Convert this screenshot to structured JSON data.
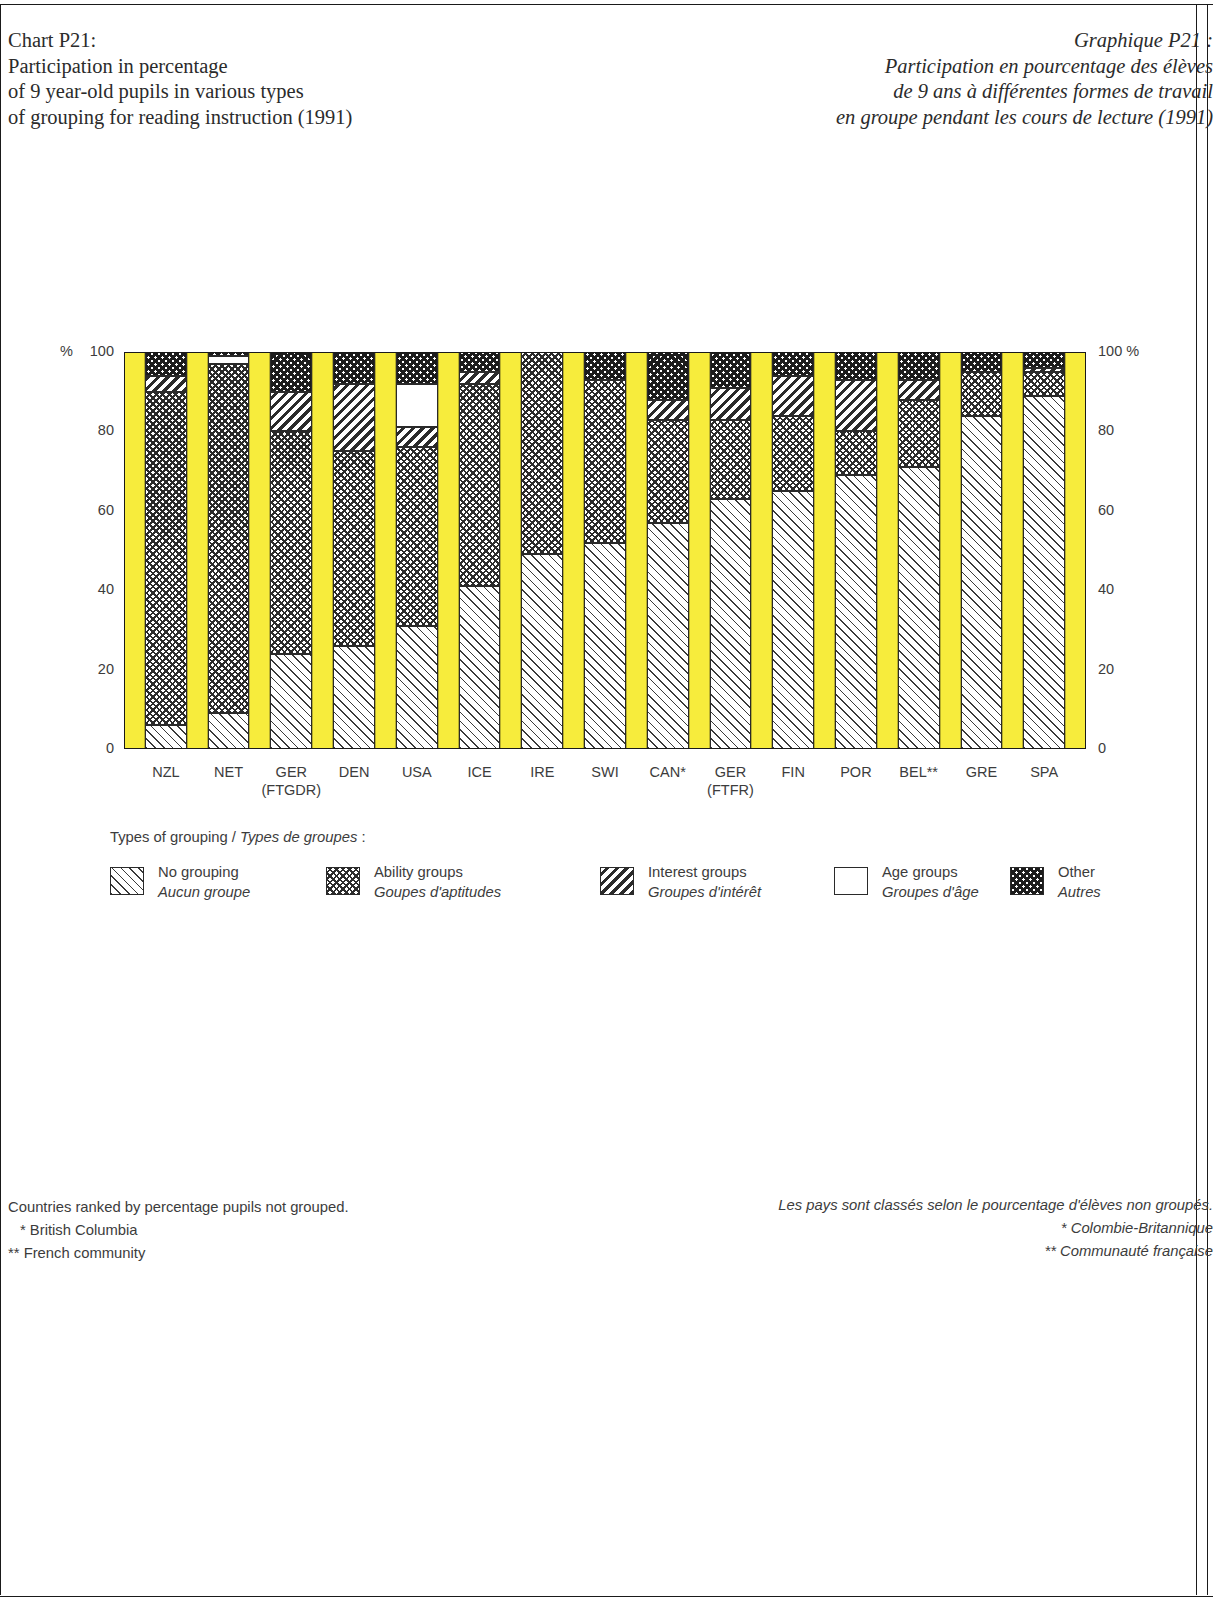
{
  "titles": {
    "en": [
      "Chart P21:",
      "Participation in percentage",
      "of 9 year-old pupils in various types",
      "of grouping for reading instruction (1991)"
    ],
    "fr": [
      "Graphique P21 :",
      "Participation en pourcentage des élèves",
      "de 9 ans à différentes formes de travail",
      "en groupe pendant les cours de lecture (1991)"
    ]
  },
  "axis": {
    "unit_left": "%",
    "unit_right": "100 %",
    "ticks_left": [
      "100",
      "80",
      "60",
      "40",
      "20",
      "0"
    ],
    "ticks_right": [
      "100 %",
      "80",
      "60",
      "40",
      "20",
      "0"
    ]
  },
  "legend": {
    "heading_en": "Types of grouping / ",
    "heading_fr": "Types de groupes",
    "heading_colon": " :",
    "items": [
      {
        "key": "none",
        "en": "No grouping",
        "fr": "Aucun groupe",
        "swatch": "diagonal-hatch-light"
      },
      {
        "key": "ability",
        "en": "Ability groups",
        "fr": "Goupes d'aptitudes",
        "swatch": "cross-hatch-medium"
      },
      {
        "key": "interest",
        "en": "Interest groups",
        "fr": "Groupes d'intérêt",
        "swatch": "diagonal-hatch-heavy"
      },
      {
        "key": "age",
        "en": "Age groups",
        "fr": "Groupes d'âge",
        "swatch": "blank-white"
      },
      {
        "key": "other",
        "en": "Other",
        "fr": "Autres",
        "swatch": "cross-hatch-dark"
      }
    ]
  },
  "footnotes": {
    "left": [
      "Countries ranked by percentage pupils not grouped.",
      "* British Columbia",
      "** French community"
    ],
    "right": [
      "Les pays sont classés selon le pourcentage d'élèves non groupés.",
      "* Colombie-Britannique",
      "** Communauté française"
    ]
  },
  "colors": {
    "separator": "#f7ec3c",
    "ink": "#2a2a2a",
    "text": "#3c3c3c"
  },
  "chart_data": {
    "type": "bar",
    "stacked": true,
    "title": "Participation in percentage of 9 year-old pupils in various types of grouping for reading instruction (1991)",
    "xlabel": "",
    "ylabel": "%",
    "ylim": [
      0,
      100
    ],
    "yticks": [
      0,
      20,
      40,
      60,
      80,
      100
    ],
    "grid": false,
    "legend_position": "below",
    "categories": [
      "NZL",
      "NET",
      "GER\n(FTGDR)",
      "DEN",
      "USA",
      "ICE",
      "IRE",
      "SWI",
      "CAN*",
      "GER\n(FTFR)",
      "FIN",
      "POR",
      "BEL**",
      "GRE",
      "SPA"
    ],
    "category_labels": [
      {
        "line1": "NZL",
        "line2": ""
      },
      {
        "line1": "NET",
        "line2": ""
      },
      {
        "line1": "GER",
        "line2": "(FTGDR)"
      },
      {
        "line1": "DEN",
        "line2": ""
      },
      {
        "line1": "USA",
        "line2": ""
      },
      {
        "line1": "ICE",
        "line2": ""
      },
      {
        "line1": "IRE",
        "line2": ""
      },
      {
        "line1": "SWI",
        "line2": ""
      },
      {
        "line1": "CAN*",
        "line2": ""
      },
      {
        "line1": "GER",
        "line2": "(FTFR)"
      },
      {
        "line1": "FIN",
        "line2": ""
      },
      {
        "line1": "POR",
        "line2": ""
      },
      {
        "line1": "BEL**",
        "line2": ""
      },
      {
        "line1": "GRE",
        "line2": ""
      },
      {
        "line1": "SPA",
        "line2": ""
      }
    ],
    "series": [
      {
        "name": "No grouping",
        "key": "none",
        "values": [
          6,
          9,
          24,
          26,
          31,
          41,
          49,
          52,
          57,
          63,
          65,
          69,
          71,
          84,
          89
        ]
      },
      {
        "name": "Ability groups",
        "key": "ability",
        "values": [
          84,
          88,
          56,
          49,
          45,
          51,
          51,
          41,
          26,
          20,
          19,
          11,
          17,
          11,
          6
        ]
      },
      {
        "name": "Interest groups",
        "key": "interest",
        "values": [
          4,
          0,
          10,
          17,
          5,
          3,
          0,
          0,
          5,
          8,
          10,
          13,
          5,
          0,
          1
        ]
      },
      {
        "name": "Age groups",
        "key": "age",
        "values": [
          0,
          2,
          0,
          0,
          11,
          0,
          0,
          0,
          0,
          0,
          0,
          0,
          0,
          0,
          0
        ]
      },
      {
        "name": "Other",
        "key": "other",
        "values": [
          6,
          1,
          10,
          8,
          8,
          5,
          0,
          7,
          12,
          9,
          6,
          7,
          7,
          5,
          4
        ]
      }
    ]
  }
}
